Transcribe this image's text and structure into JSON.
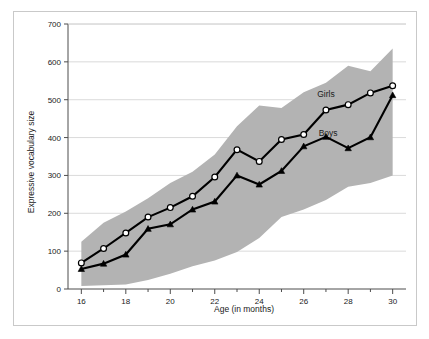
{
  "figure": {
    "background_color": "#ffffff",
    "frame_color": "#c9c9c9"
  },
  "chart_data": {
    "type": "line",
    "title": "",
    "subtitle": "",
    "xlabel": "Age (in months)",
    "ylabel": "Expressive vocabulary size",
    "xlim": [
      15.4,
      30.6
    ],
    "ylim": [
      0,
      700
    ],
    "grid": true,
    "grid_axis": "y",
    "legend_position": "inline-annotation",
    "x_tick_labels": [
      "16",
      "18",
      "20",
      "22",
      "24",
      "26",
      "28",
      "30"
    ],
    "x_tick_values": [
      16,
      18,
      20,
      22,
      24,
      26,
      28,
      30
    ],
    "x_minor_tick_values": [
      17,
      19,
      21,
      23,
      25,
      27,
      29
    ],
    "y_tick_labels": [
      "0",
      "100",
      "200",
      "300",
      "400",
      "500",
      "600",
      "700"
    ],
    "y_tick_values": [
      0,
      100,
      200,
      300,
      400,
      500,
      600,
      700
    ],
    "x": [
      16,
      17,
      18,
      19,
      20,
      21,
      22,
      23,
      24,
      25,
      26,
      27,
      28,
      29,
      30
    ],
    "series": [
      {
        "name": "Girls",
        "marker": "open-circle",
        "color": "#000000",
        "label_x": 27.0,
        "label_y": 508,
        "values": [
          69,
          107,
          148,
          190,
          215,
          245,
          296,
          368,
          337,
          395,
          408,
          473,
          487,
          518,
          537
        ]
      },
      {
        "name": "Boys",
        "marker": "filled-triangle",
        "color": "#000000",
        "label_x": 27.1,
        "label_y": 405,
        "values": [
          53,
          67,
          91,
          159,
          171,
          210,
          231,
          300,
          276,
          312,
          377,
          402,
          372,
          401,
          512
        ]
      }
    ],
    "band": {
      "name": "interquartile-range-band",
      "color": "#b3b3b3",
      "upper": [
        125,
        175,
        205,
        240,
        280,
        310,
        355,
        430,
        485,
        478,
        520,
        545,
        590,
        575,
        635
      ],
      "lower": [
        8,
        10,
        12,
        24,
        40,
        60,
        75,
        98,
        135,
        190,
        210,
        235,
        270,
        280,
        300
      ]
    }
  }
}
